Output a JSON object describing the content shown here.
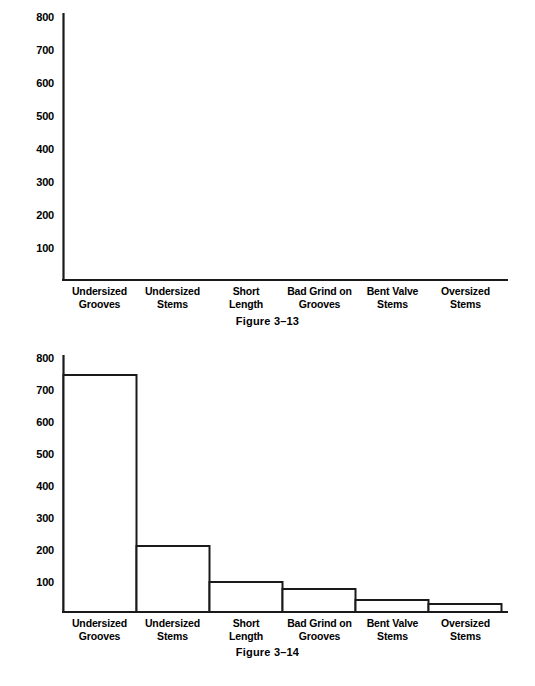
{
  "page": {
    "background": "#ffffff",
    "ink": "#1a1a1a"
  },
  "charts": [
    {
      "id": "figure-3-13",
      "caption": "Figure 3–13",
      "y_ticks": [
        "800",
        "700",
        "600",
        "500",
        "400",
        "300",
        "200",
        "100"
      ],
      "categories": [
        "Undersized\nGrooves",
        "Undersized\nStems",
        "Short\nLength",
        "Bad Grind on\nGrooves",
        "Bent Valve\nStems",
        "Oversized\nStems"
      ]
    },
    {
      "id": "figure-3-14",
      "caption": "Figure 3–14",
      "y_ticks": [
        "800",
        "700",
        "600",
        "500",
        "400",
        "300",
        "200",
        "100"
      ],
      "categories": [
        "Undersized\nGrooves",
        "Undersized\nStems",
        "Short\nLength",
        "Bad Grind on\nGrooves",
        "Bent Valve\nStems",
        "Oversized\nStems"
      ]
    }
  ],
  "chart_data": [
    {
      "type": "bar",
      "title": "Figure 3–13",
      "categories": [
        "Undersized Grooves",
        "Undersized Stems",
        "Short Length",
        "Bad Grind on Grooves",
        "Bent Valve Stems",
        "Oversized Stems"
      ],
      "values": [
        0,
        0,
        0,
        0,
        0,
        0
      ],
      "xlabel": "",
      "ylabel": "",
      "ylim": [
        0,
        840
      ],
      "yticks": [
        100,
        200,
        300,
        400,
        500,
        600,
        700,
        800
      ],
      "grid": false,
      "legend": false,
      "bar_style": "outline",
      "note": "blank axes – no bars drawn"
    },
    {
      "type": "bar",
      "title": "Figure 3–14",
      "categories": [
        "Undersized Grooves",
        "Undersized Stems",
        "Short Length",
        "Bad Grind on Grooves",
        "Bent Valve Stems",
        "Oversized Stems"
      ],
      "values": [
        740,
        210,
        95,
        75,
        40,
        28
      ],
      "xlabel": "",
      "ylabel": "",
      "ylim": [
        0,
        840
      ],
      "yticks": [
        100,
        200,
        300,
        400,
        500,
        600,
        700,
        800
      ],
      "grid": false,
      "legend": false,
      "bar_style": "outline",
      "note": "descending Pareto histogram, adjacent bars"
    }
  ]
}
